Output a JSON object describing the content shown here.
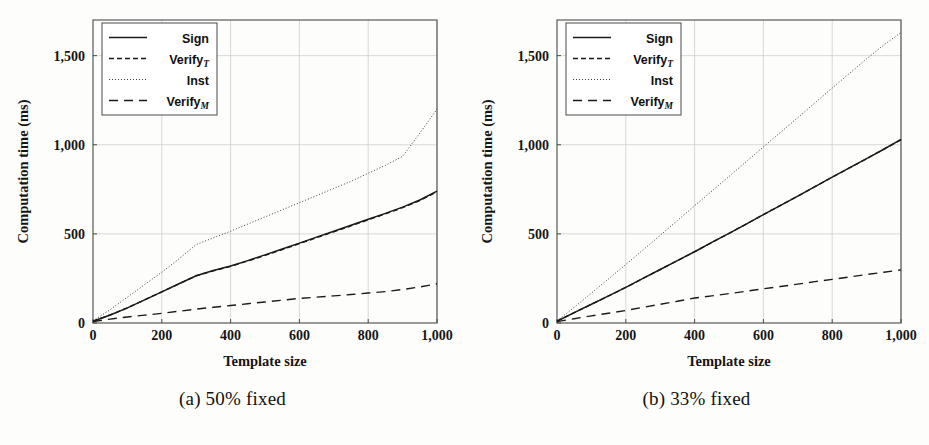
{
  "figure": {
    "background": "#fdfdfc",
    "ink": "#1a1a1a",
    "grid_color": "#c9c9c9",
    "axis_color": "#4a4a4a"
  },
  "panels": [
    {
      "id": "a",
      "caption": "(a) 50% fixed",
      "chart_data": {
        "type": "line",
        "title": "(a) 50% fixed",
        "xlabel": "Template size",
        "ylabel": "Computation time (ms)",
        "xlim": [
          0,
          1000
        ],
        "ylim": [
          0,
          1700
        ],
        "xticks": [
          0,
          200,
          400,
          600,
          800,
          1000
        ],
        "xticklabels": [
          "0",
          "200",
          "400",
          "600",
          "800",
          "1,000"
        ],
        "yticks": [
          0,
          500,
          1000,
          1500
        ],
        "yticklabels": [
          "0",
          "500",
          "1,000",
          "1,500"
        ],
        "grid": true,
        "legend_position": "upper left",
        "x": [
          0,
          50,
          100,
          150,
          200,
          250,
          300,
          350,
          400,
          450,
          500,
          550,
          600,
          650,
          700,
          750,
          800,
          850,
          900,
          950,
          1000
        ],
        "series": [
          {
            "name": "Sign",
            "style": "solid",
            "values": [
              10,
              45,
              85,
              130,
              175,
              220,
              265,
              295,
              320,
              350,
              382,
              415,
              448,
              482,
              515,
              548,
              582,
              615,
              650,
              690,
              740
            ]
          },
          {
            "name": "Verify_T",
            "label": "Verify",
            "subscript": "T",
            "style": "dashed-medium",
            "values": [
              10,
              45,
              85,
              130,
              175,
              220,
              265,
              293,
              318,
              348,
              379,
              412,
              445,
              479,
              512,
              545,
              579,
              612,
              647,
              687,
              736
            ]
          },
          {
            "name": "Inst",
            "style": "dotted",
            "values": [
              12,
              75,
              145,
              215,
              285,
              360,
              440,
              478,
              515,
              555,
              595,
              635,
              675,
              715,
              755,
              795,
              840,
              885,
              935,
              1065,
              1200
            ]
          },
          {
            "name": "Verify_M",
            "label": "Verify",
            "subscript": "M",
            "style": "dashed-long",
            "values": [
              8,
              22,
              34,
              44,
              54,
              66,
              78,
              88,
              98,
              108,
              118,
              128,
              138,
              145,
              152,
              160,
              168,
              176,
              188,
              202,
              220
            ]
          }
        ]
      }
    },
    {
      "id": "b",
      "caption": "(b) 33% fixed",
      "chart_data": {
        "type": "line",
        "title": "(b) 33% fixed",
        "xlabel": "Template size",
        "ylabel": "Computation time (ms)",
        "xlim": [
          0,
          1000
        ],
        "ylim": [
          0,
          1700
        ],
        "xticks": [
          0,
          200,
          400,
          600,
          800,
          1000
        ],
        "xticklabels": [
          "0",
          "200",
          "400",
          "600",
          "800",
          "1,000"
        ],
        "yticks": [
          0,
          500,
          1000,
          1500
        ],
        "yticklabels": [
          "0",
          "500",
          "1,000",
          "1,500"
        ],
        "grid": true,
        "legend_position": "upper left",
        "x": [
          0,
          50,
          100,
          150,
          200,
          250,
          300,
          350,
          400,
          450,
          500,
          550,
          600,
          650,
          700,
          750,
          800,
          850,
          900,
          950,
          1000
        ],
        "series": [
          {
            "name": "Sign",
            "style": "solid",
            "values": [
              10,
              58,
              105,
              152,
              200,
              250,
              300,
              350,
              400,
              452,
              503,
              555,
              608,
              660,
              712,
              765,
              818,
              870,
              922,
              975,
              1030
            ]
          },
          {
            "name": "Verify_T",
            "label": "Verify",
            "subscript": "T",
            "style": "dashed-medium",
            "values": [
              10,
              58,
              105,
              152,
              200,
              250,
              300,
              350,
              400,
              452,
              503,
              555,
              608,
              660,
              712,
              765,
              818,
              870,
              922,
              975,
              1028
            ]
          },
          {
            "name": "Inst",
            "style": "dotted",
            "values": [
              12,
              88,
              168,
              248,
              328,
              410,
              492,
              575,
              658,
              740,
              822,
              905,
              988,
              1070,
              1152,
              1235,
              1318,
              1400,
              1482,
              1560,
              1630
            ]
          },
          {
            "name": "Verify_M",
            "label": "Verify",
            "subscript": "M",
            "style": "dashed-long",
            "values": [
              8,
              24,
              40,
              55,
              70,
              88,
              105,
              122,
              140,
              152,
              165,
              178,
              192,
              205,
              218,
              232,
              245,
              258,
              272,
              285,
              298
            ]
          }
        ]
      }
    }
  ],
  "legend": {
    "items": [
      {
        "label": "Sign",
        "subscript": "",
        "style": "solid"
      },
      {
        "label": "Verify",
        "subscript": "T",
        "style": "dashed-medium"
      },
      {
        "label": "Inst",
        "subscript": "",
        "style": "dotted"
      },
      {
        "label": "Verify",
        "subscript": "M",
        "style": "dashed-long"
      }
    ]
  }
}
